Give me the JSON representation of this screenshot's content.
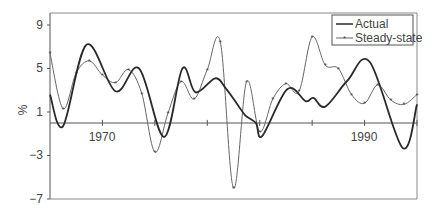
{
  "chart_data": {
    "type": "line",
    "title": "",
    "xlabel": "",
    "ylabel": "%",
    "xlim": [
      1966,
      1994
    ],
    "ylim": [
      -7,
      10
    ],
    "yticks": [
      9,
      5,
      1,
      -3,
      -7
    ],
    "xticks": [
      1970,
      1974,
      1978,
      1982,
      1986,
      1990,
      1994
    ],
    "xtick_labels": [
      {
        "year": 1970,
        "label": "1970"
      },
      {
        "year": 1990,
        "label": "1990"
      }
    ],
    "grid": false,
    "legend_position": "top-right",
    "series": [
      {
        "name": "Actual",
        "style": "thick-line",
        "color": "#333333",
        "x": [
          1966,
          1967.0,
          1968.8,
          1971.0,
          1972.8,
          1974.7,
          1976.1,
          1977.1,
          1978.6,
          1979.4,
          1980.3,
          1980.9,
          1981.7,
          1982.2,
          1984.1,
          1985.5,
          1986.1,
          1987.0,
          1988.7,
          1990.4,
          1992.9,
          1994
        ],
        "values": [
          2.6,
          -0.3,
          7.2,
          2.9,
          5.0,
          -1.3,
          5.0,
          2.8,
          4.1,
          3.2,
          1.7,
          0.7,
          0.0,
          -1.2,
          3.1,
          2.0,
          2.3,
          1.5,
          3.9,
          5.6,
          -2.3,
          1.7
        ]
      },
      {
        "name": "Steady-state",
        "style": "thin-line-markers",
        "color": "#555555",
        "x": [
          1966,
          1967,
          1968,
          1969,
          1970,
          1971,
          1972,
          1973,
          1974,
          1975,
          1976,
          1977,
          1978,
          1979,
          1980,
          1981,
          1982,
          1983,
          1984,
          1985,
          1986,
          1987,
          1988,
          1989,
          1990,
          1991,
          1992,
          1993,
          1994
        ],
        "values": [
          6.4,
          1.3,
          4.6,
          5.7,
          4.4,
          3.7,
          4.9,
          2.7,
          -2.7,
          0.9,
          3.8,
          2.2,
          4.9,
          7.4,
          -6.0,
          3.8,
          -0.8,
          2.2,
          3.6,
          2.9,
          7.9,
          5.3,
          5.0,
          2.6,
          1.8,
          3.5,
          2.1,
          1.7,
          2.6
        ]
      }
    ]
  },
  "legend": {
    "items": [
      {
        "label": "Actual"
      },
      {
        "label": "Steady-state"
      }
    ]
  },
  "axis": {
    "ylabel": "%",
    "ytick_labels": [
      "9",
      "5",
      "1",
      "−3",
      "−7"
    ],
    "xtick_labels": [
      "1970",
      "1990"
    ]
  }
}
